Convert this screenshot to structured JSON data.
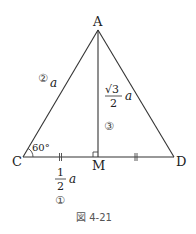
{
  "figure": {
    "caption": "図 4-21",
    "points": {
      "A": {
        "label": "A",
        "x": 98,
        "y": 30
      },
      "C": {
        "label": "C",
        "x": 23,
        "y": 157
      },
      "M": {
        "label": "M",
        "x": 98,
        "y": 157
      },
      "D": {
        "label": "D",
        "x": 174,
        "y": 157
      }
    },
    "angle_C": "60°",
    "side_CA": {
      "marker": "②",
      "value": "a"
    },
    "segment_CM": {
      "numerator": "1",
      "denominator": "2",
      "value": "a",
      "marker": "①"
    },
    "segment_AM": {
      "radical": "√3",
      "denominator": "2",
      "value": "a",
      "marker": "③"
    },
    "equal_marks": "||",
    "right_angle_at": "M"
  }
}
